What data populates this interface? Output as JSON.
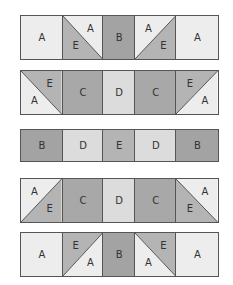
{
  "colors": {
    "A": "#ededed",
    "B": "#a3a3a3",
    "C": "#a8a8a8",
    "D": "#dcdcdc",
    "E": "#b4b4b4",
    "border": "#555555"
  },
  "column_widths": [
    42,
    41,
    32,
    42,
    42
  ],
  "rows": [
    {
      "top": 15,
      "height": 45,
      "cells": [
        {
          "type": "solid",
          "fill": "A",
          "label": "A"
        },
        {
          "type": "tri",
          "diag": "tl-br",
          "upper": "A",
          "lower": "E",
          "upper_label": "A",
          "lower_label": "E"
        },
        {
          "type": "solid",
          "fill": "B",
          "label": "B"
        },
        {
          "type": "tri",
          "diag": "bl-tr",
          "upper": "A",
          "lower": "E",
          "upper_label": "A",
          "lower_label": "E"
        },
        {
          "type": "solid",
          "fill": "A",
          "label": "A"
        }
      ]
    },
    {
      "top": 70,
      "height": 45,
      "cells": [
        {
          "type": "tri",
          "diag": "tl-br",
          "upper": "E",
          "lower": "A",
          "upper_label": "E",
          "lower_label": "A"
        },
        {
          "type": "solid",
          "fill": "C",
          "label": "C"
        },
        {
          "type": "solid",
          "fill": "D",
          "label": "D"
        },
        {
          "type": "solid",
          "fill": "C",
          "label": "C"
        },
        {
          "type": "tri",
          "diag": "bl-tr",
          "upper": "E",
          "lower": "A",
          "upper_label": "E",
          "lower_label": "A"
        }
      ]
    },
    {
      "top": 129,
      "height": 33,
      "cells": [
        {
          "type": "solid",
          "fill": "B",
          "label": "B"
        },
        {
          "type": "solid",
          "fill": "D",
          "label": "D"
        },
        {
          "type": "solid",
          "fill": "E",
          "label": "E"
        },
        {
          "type": "solid",
          "fill": "D",
          "label": "D"
        },
        {
          "type": "solid",
          "fill": "B",
          "label": "B"
        }
      ]
    },
    {
      "top": 178,
      "height": 45,
      "cells": [
        {
          "type": "tri",
          "diag": "bl-tr",
          "upper": "A",
          "lower": "E",
          "upper_label": "A",
          "lower_label": "E"
        },
        {
          "type": "solid",
          "fill": "C",
          "label": "C"
        },
        {
          "type": "solid",
          "fill": "D",
          "label": "D"
        },
        {
          "type": "solid",
          "fill": "C",
          "label": "C"
        },
        {
          "type": "tri",
          "diag": "tl-br",
          "upper": "A",
          "lower": "E",
          "upper_label": "A",
          "lower_label": "E"
        }
      ]
    },
    {
      "top": 232,
      "height": 45,
      "cells": [
        {
          "type": "solid",
          "fill": "A",
          "label": "A"
        },
        {
          "type": "tri",
          "diag": "bl-tr",
          "upper": "E",
          "lower": "A",
          "upper_label": "E",
          "lower_label": "A"
        },
        {
          "type": "solid",
          "fill": "B",
          "label": "B"
        },
        {
          "type": "tri",
          "diag": "tl-br",
          "upper": "E",
          "lower": "A",
          "upper_label": "E",
          "lower_label": "A"
        },
        {
          "type": "solid",
          "fill": "A",
          "label": "A"
        }
      ]
    }
  ]
}
